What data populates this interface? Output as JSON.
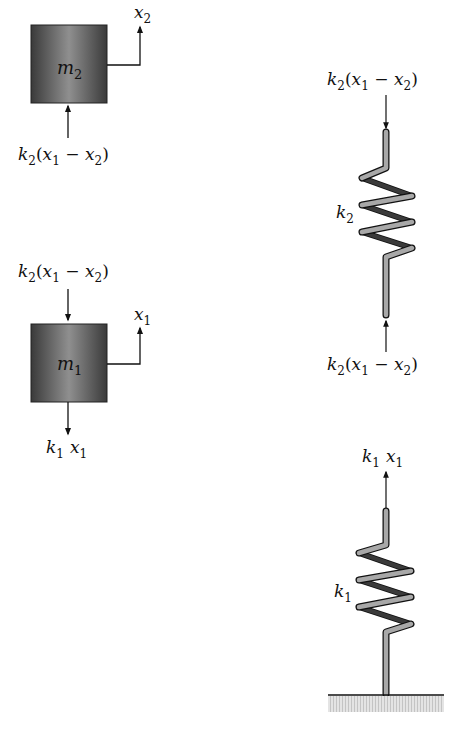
{
  "diagram": {
    "type": "free-body diagram",
    "masses": [
      {
        "id": "m2",
        "label": "m",
        "sub": "2",
        "displacement": {
          "label": "x",
          "sub": "2"
        },
        "forces": [
          {
            "direction": "up",
            "from": "below",
            "text": "k2(x1 − x2)"
          }
        ]
      },
      {
        "id": "m1",
        "label": "m",
        "sub": "1",
        "displacement": {
          "label": "x",
          "sub": "1"
        },
        "forces": [
          {
            "direction": "down",
            "from": "above",
            "text": "k2(x1 − x2)"
          },
          {
            "direction": "down",
            "from": "below",
            "text": "k1 x1"
          }
        ]
      }
    ],
    "springs": [
      {
        "id": "k2",
        "label": "k",
        "sub": "2",
        "top_force": "k2(x1 − x2)",
        "bottom_force": "k2(x1 − x2)"
      },
      {
        "id": "k1",
        "label": "k",
        "sub": "1",
        "top_force": "k1 x1",
        "grounded": true
      }
    ],
    "colors": {
      "mass_dark": "#3a3a3a",
      "mass_light": "#8a8a8a",
      "spring_front": "#a6a6a6",
      "spring_back": "#2a2a2a",
      "ground_hatch": "#cfcfcf",
      "line": "#111111"
    }
  },
  "labels": {
    "m2": {
      "main": "m",
      "sub": "2"
    },
    "m1": {
      "main": "m",
      "sub": "1"
    },
    "x2": {
      "main": "x",
      "sub": "2"
    },
    "x1": {
      "main": "x",
      "sub": "1"
    },
    "k2": {
      "main": "k",
      "sub": "2"
    },
    "k1": {
      "main": "k",
      "sub": "1"
    },
    "force_k2": {
      "k": "k",
      "ksub": "2",
      "open": "(",
      "x1": "x",
      "x1sub": "1",
      "minus": " − ",
      "x2": "x",
      "x2sub": "2",
      "close": ")"
    },
    "force_k1": {
      "k": "k",
      "ksub": "1",
      "x": "x",
      "xsub": "1"
    }
  }
}
